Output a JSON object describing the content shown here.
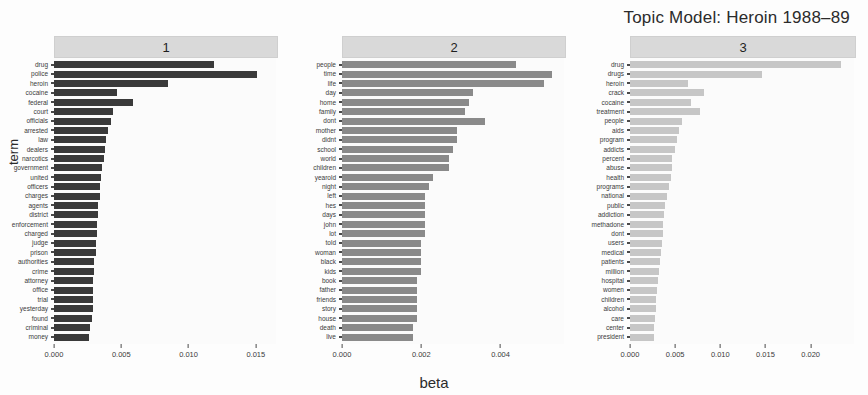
{
  "title": "Topic Model: Heroin 1988–89",
  "axis": {
    "x_label": "beta",
    "y_label": "term"
  },
  "colors": {
    "topic1_bar": "#3a3a3a",
    "topic2_bar": "#8a8a8a",
    "topic3_bar": "#c6c6c6",
    "strip_bg": "#d9d9d9",
    "panel_bg": "#fbfbfb",
    "text": "#2b2b2b"
  },
  "chart_data": {
    "type": "bar",
    "title": "Topic Model: Heroin 1988–89",
    "xlabel": "beta",
    "ylabel": "term",
    "orientation": "horizontal",
    "grid": false,
    "legend": "none",
    "facets": [
      {
        "label": "1",
        "xlim": [
          0.0,
          0.0165
        ],
        "xticks": [
          0.0,
          0.005,
          0.01,
          0.015
        ],
        "xticklabels": [
          "0.000",
          "0.005",
          "0.010",
          "0.015"
        ],
        "bar_color": "#3a3a3a",
        "categories": [
          "drug",
          "police",
          "heroin",
          "cocaine",
          "federal",
          "court",
          "officials",
          "arrested",
          "law",
          "dealers",
          "narcotics",
          "government",
          "united",
          "officers",
          "charges",
          "agents",
          "district",
          "enforcement",
          "charged",
          "judge",
          "prison",
          "authorities",
          "crime",
          "attorney",
          "office",
          "trial",
          "yesterday",
          "found",
          "criminal",
          "money"
        ],
        "values": [
          0.0119,
          0.0151,
          0.0085,
          0.0047,
          0.0059,
          0.0044,
          0.0042,
          0.004,
          0.0039,
          0.0038,
          0.0037,
          0.0036,
          0.0035,
          0.0034,
          0.0034,
          0.0033,
          0.0033,
          0.0032,
          0.0032,
          0.0031,
          0.0031,
          0.003,
          0.003,
          0.0029,
          0.0029,
          0.0029,
          0.0029,
          0.0028,
          0.0027,
          0.0026
        ]
      },
      {
        "label": "2",
        "xlim": [
          0.0,
          0.0056
        ],
        "xticks": [
          0.0,
          0.002,
          0.004
        ],
        "xticklabels": [
          "0.000",
          "0.002",
          "0.004"
        ],
        "bar_color": "#8a8a8a",
        "categories": [
          "people",
          "time",
          "life",
          "day",
          "home",
          "family",
          "dont",
          "mother",
          "didnt",
          "school",
          "world",
          "children",
          "yearold",
          "night",
          "left",
          "hes",
          "days",
          "john",
          "lot",
          "told",
          "woman",
          "black",
          "kids",
          "book",
          "father",
          "friends",
          "story",
          "house",
          "death",
          "live"
        ],
        "values": [
          0.0044,
          0.0053,
          0.0051,
          0.0033,
          0.0032,
          0.0031,
          0.0036,
          0.0029,
          0.0029,
          0.0028,
          0.0027,
          0.0027,
          0.0023,
          0.0022,
          0.0021,
          0.0021,
          0.0021,
          0.0021,
          0.0021,
          0.002,
          0.002,
          0.002,
          0.002,
          0.0019,
          0.0019,
          0.0019,
          0.0019,
          0.0019,
          0.0018,
          0.0018
        ]
      },
      {
        "label": "3",
        "xlim": [
          0.0,
          0.0248
        ],
        "xticks": [
          0.0,
          0.005,
          0.01,
          0.015,
          0.02
        ],
        "xticklabels": [
          "0.000",
          "0.005",
          "0.010",
          "0.015",
          "0.020"
        ],
        "bar_color": "#c6c6c6",
        "categories": [
          "drug",
          "drugs",
          "heroin",
          "crack",
          "cocaine",
          "treatment",
          "people",
          "aids",
          "program",
          "addicts",
          "percent",
          "abuse",
          "health",
          "programs",
          "national",
          "public",
          "addiction",
          "methadone",
          "dont",
          "users",
          "medical",
          "patients",
          "million",
          "hospital",
          "women",
          "children",
          "alcohol",
          "care",
          "center",
          "president"
        ],
        "values": [
          0.0234,
          0.0146,
          0.0064,
          0.0082,
          0.0068,
          0.0078,
          0.0058,
          0.0054,
          0.0052,
          0.005,
          0.0047,
          0.0046,
          0.0045,
          0.0043,
          0.0041,
          0.0039,
          0.0038,
          0.0037,
          0.0036,
          0.0035,
          0.0034,
          0.0033,
          0.0032,
          0.0031,
          0.003,
          0.0029,
          0.0029,
          0.0028,
          0.0027,
          0.0027
        ]
      }
    ]
  }
}
